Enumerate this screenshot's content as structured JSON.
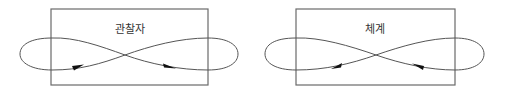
{
  "diagrams": [
    {
      "label": "관찰자",
      "box": {
        "x": 51,
        "y": 9,
        "w": 157,
        "h": 76
      },
      "flow_direction": "rightward"
    },
    {
      "label": "체계",
      "box": {
        "x": 296,
        "y": 9,
        "w": 159,
        "h": 76
      },
      "flow_direction": "leftward"
    }
  ],
  "colors": {
    "box_stroke": "#6a6a6a",
    "curve_stroke": "#555555",
    "arrowhead": "#111111",
    "label": "#333333"
  }
}
